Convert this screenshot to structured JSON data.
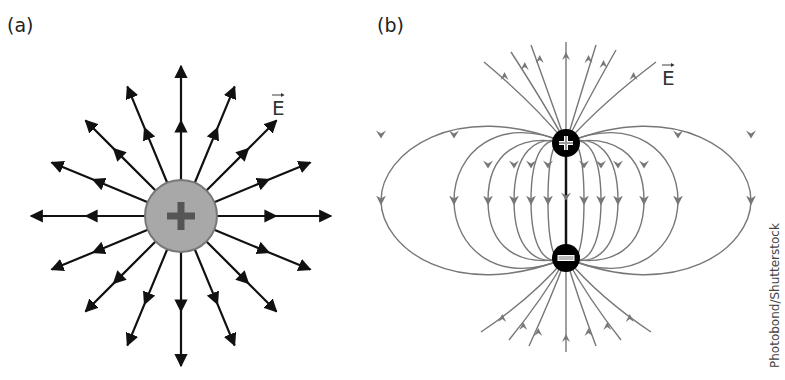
{
  "panels": {
    "a": {
      "label": "(a)",
      "field_label": "E",
      "charge": {
        "sign": "+",
        "cx": 181,
        "cy": 216,
        "r": 36,
        "fill": "#a8a8a8",
        "stroke": "#777777"
      },
      "field_lines": {
        "count": 16,
        "direction": "outward",
        "color": "#111111"
      }
    },
    "b": {
      "label": "(b)",
      "field_label": "E",
      "positive_charge": {
        "sign": "+",
        "cx": 566,
        "cy": 143,
        "r": 14
      },
      "negative_charge": {
        "sign": "−",
        "cx": 566,
        "cy": 258,
        "r": 14
      },
      "field_lines": {
        "direction": "from + to −",
        "color": "#777777"
      }
    }
  },
  "credit": "Photobond/Shutterstock",
  "colors": {
    "background": "#ffffff",
    "arrow_black": "#111111",
    "dipole_line": "#777777",
    "charge_black": "#000000"
  }
}
